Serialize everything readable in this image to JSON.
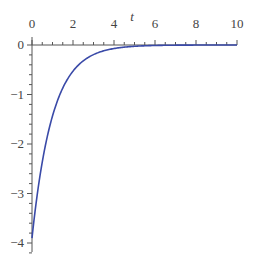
{
  "chart_data": {
    "type": "line",
    "title": "",
    "xlabel": "t",
    "ylabel": "",
    "xlim": [
      0,
      10
    ],
    "ylim": [
      -4,
      0
    ],
    "x_ticks": [
      0,
      2,
      4,
      6,
      8,
      10
    ],
    "x_tick_labels": [
      "0",
      "2",
      "4",
      "6",
      "8",
      "10"
    ],
    "y_ticks": [
      0,
      -1,
      -2,
      -3,
      -4
    ],
    "y_tick_labels": [
      "0",
      "−1",
      "−2",
      "−3",
      "−4"
    ],
    "x_axis_position": "top (at y=0)",
    "grid": false,
    "legend": null,
    "series": [
      {
        "name": "curve",
        "color": "#3a4aa8",
        "x": [
          0,
          0.25,
          0.5,
          0.75,
          1,
          1.5,
          2,
          2.5,
          3,
          3.5,
          4,
          5,
          6,
          7,
          8,
          9,
          10
        ],
        "y": [
          -3.9,
          -3.04,
          -2.37,
          -1.85,
          -1.44,
          -0.87,
          -0.53,
          -0.32,
          -0.19,
          -0.12,
          -0.07,
          -0.03,
          -0.01,
          0,
          0,
          0,
          0
        ]
      }
    ]
  },
  "colors": {
    "axis": "#555555",
    "curve": "#3a4aa8"
  }
}
